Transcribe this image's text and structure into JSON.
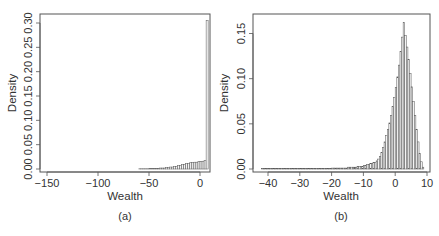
{
  "chart_data": [
    {
      "type": "bar",
      "subtype": "histogram",
      "panel": "(a)",
      "xlabel": "Wealth",
      "ylabel": "Density",
      "xlim": [
        -152,
        8
      ],
      "ylim": [
        0,
        0.31
      ],
      "x_ticks": [
        -150,
        -100,
        -50,
        0
      ],
      "x_tick_labels": [
        "−150",
        "−100",
        "−50",
        "0"
      ],
      "y_ticks": [
        0.0,
        0.05,
        0.1,
        0.15,
        0.2,
        0.25,
        0.3
      ],
      "y_tick_labels": [
        "0.00",
        "0.05",
        "0.10",
        "0.15",
        "0.20",
        "0.25",
        "0.30"
      ],
      "grid": false,
      "bin_width": 2,
      "bins": [
        {
          "x0": -150,
          "x1": -60,
          "density": 0.0
        },
        {
          "x0": -60,
          "x1": -50,
          "density": 0.0005
        },
        {
          "x0": -50,
          "x1": -40,
          "density": 0.001
        },
        {
          "x0": -40,
          "x1": -34,
          "density": 0.002
        },
        {
          "x0": -34,
          "x1": -30,
          "density": 0.003
        },
        {
          "x0": -30,
          "x1": -26,
          "density": 0.004
        },
        {
          "x0": -26,
          "x1": -22,
          "density": 0.005
        },
        {
          "x0": -22,
          "x1": -18,
          "density": 0.007
        },
        {
          "x0": -18,
          "x1": -14,
          "density": 0.009
        },
        {
          "x0": -14,
          "x1": -10,
          "density": 0.011
        },
        {
          "x0": -10,
          "x1": -6,
          "density": 0.013
        },
        {
          "x0": -6,
          "x1": -2,
          "density": 0.014
        },
        {
          "x0": -2,
          "x1": 2,
          "density": 0.015
        },
        {
          "x0": 2,
          "x1": 4,
          "density": 0.016
        },
        {
          "x0": 4,
          "x1": 6,
          "density": 0.017
        },
        {
          "x0": 6,
          "x1": 8,
          "density": 0.305
        }
      ]
    },
    {
      "type": "bar",
      "subtype": "histogram",
      "panel": "(b)",
      "xlabel": "Wealth",
      "ylabel": "Density",
      "xlim": [
        -43,
        10
      ],
      "ylim": [
        0,
        0.165
      ],
      "x_ticks": [
        -40,
        -30,
        -20,
        -10,
        0,
        10
      ],
      "x_tick_labels": [
        "−40",
        "−30",
        "−20",
        "−10",
        "0",
        "10"
      ],
      "y_ticks": [
        0.0,
        0.05,
        0.1,
        0.15
      ],
      "y_tick_labels": [
        "0.00",
        "0.05",
        "0.10",
        "0.15"
      ],
      "grid": false,
      "bin_width": 0.5,
      "bins_x_start": -42,
      "densities_note": "one value per 0.5-wide bin from -42 to 9",
      "bins": [
        {
          "x0": -42,
          "x1": -20,
          "density": 0.0005
        },
        {
          "x0": -20,
          "x1": -15,
          "density": 0.001
        },
        {
          "x0": -15,
          "x1": -12,
          "density": 0.002
        },
        {
          "x0": -12,
          "x1": -10,
          "density": 0.003
        },
        {
          "x0": -10,
          "x1": -9,
          "density": 0.004
        },
        {
          "x0": -9,
          "x1": -8,
          "density": 0.005
        },
        {
          "x0": -8,
          "x1": -7,
          "density": 0.006
        },
        {
          "x0": -7,
          "x1": -6,
          "density": 0.007
        },
        {
          "x0": -6,
          "x1": -5.5,
          "density": 0.009
        },
        {
          "x0": -5.5,
          "x1": -5,
          "density": 0.011
        },
        {
          "x0": -5,
          "x1": -4.5,
          "density": 0.014
        },
        {
          "x0": -4.5,
          "x1": -4,
          "density": 0.018
        },
        {
          "x0": -4,
          "x1": -3.5,
          "density": 0.024
        },
        {
          "x0": -3.5,
          "x1": -3,
          "density": 0.03
        },
        {
          "x0": -3,
          "x1": -2.5,
          "density": 0.037
        },
        {
          "x0": -2.5,
          "x1": -2,
          "density": 0.044
        },
        {
          "x0": -2,
          "x1": -1.5,
          "density": 0.051
        },
        {
          "x0": -1.5,
          "x1": -1,
          "density": 0.059
        },
        {
          "x0": -1,
          "x1": -0.5,
          "density": 0.069
        },
        {
          "x0": -0.5,
          "x1": 0,
          "density": 0.079
        },
        {
          "x0": 0,
          "x1": 0.5,
          "density": 0.09
        },
        {
          "x0": 0.5,
          "x1": 1,
          "density": 0.102
        },
        {
          "x0": 1,
          "x1": 1.5,
          "density": 0.115
        },
        {
          "x0": 1.5,
          "x1": 2,
          "density": 0.13
        },
        {
          "x0": 2,
          "x1": 2.5,
          "density": 0.146
        },
        {
          "x0": 2.5,
          "x1": 3,
          "density": 0.162
        },
        {
          "x0": 3,
          "x1": 3.5,
          "density": 0.148
        },
        {
          "x0": 3.5,
          "x1": 4,
          "density": 0.135
        },
        {
          "x0": 4,
          "x1": 4.5,
          "density": 0.121
        },
        {
          "x0": 4.5,
          "x1": 5,
          "density": 0.106
        },
        {
          "x0": 5,
          "x1": 5.5,
          "density": 0.091
        },
        {
          "x0": 5.5,
          "x1": 6,
          "density": 0.075
        },
        {
          "x0": 6,
          "x1": 6.5,
          "density": 0.059
        },
        {
          "x0": 6.5,
          "x1": 7,
          "density": 0.044
        },
        {
          "x0": 7,
          "x1": 7.5,
          "density": 0.03
        },
        {
          "x0": 7.5,
          "x1": 8,
          "density": 0.017
        },
        {
          "x0": 8,
          "x1": 8.5,
          "density": 0.008
        },
        {
          "x0": 8.5,
          "x1": 9,
          "density": 0.002
        }
      ]
    }
  ],
  "panels": {
    "a": {
      "label": "(a)",
      "xlabel": "Wealth",
      "ylabel": "Density"
    },
    "b": {
      "label": "(b)",
      "xlabel": "Wealth",
      "ylabel": "Density"
    }
  }
}
